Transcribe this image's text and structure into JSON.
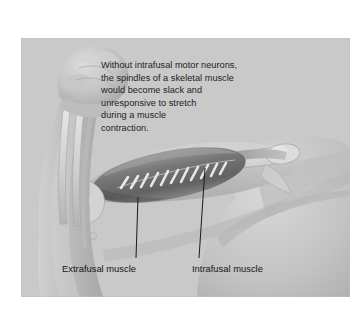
{
  "figure": {
    "domain": "diagram",
    "background_color": "#ffffff",
    "panel_color": "#c9c9c9"
  },
  "caption": {
    "text": "Without intrafusal motor neurons,\nthe spindles of a skeletal muscle\nwould become slack and\nunresponsive to stretch\nduring a muscle\ncontraction.",
    "color": "#1d1d1d"
  },
  "labels": [
    {
      "id": "extrafusal",
      "text": "Extrafusal muscle",
      "color": "#161616",
      "leader_line": {
        "x1": 138,
        "y1": 197,
        "x2": 136,
        "y2": 258
      }
    },
    {
      "id": "intrafusal",
      "text": "Intrafusal muscle",
      "color": "#161616",
      "leader_line": {
        "x1": 205,
        "y1": 168,
        "x2": 199,
        "y2": 258
      }
    }
  ],
  "anatomy": {
    "parts": [
      {
        "name": "clenched-fist",
        "tone": "#b9b9b9"
      },
      {
        "name": "forearm",
        "tone": "#bdbdbd"
      },
      {
        "name": "radius-bone",
        "tone": "#d6d6d6"
      },
      {
        "name": "ulna-bone",
        "tone": "#d6d6d6"
      },
      {
        "name": "elbow-joint",
        "tone": "#d2d2d2"
      },
      {
        "name": "humerus-bone",
        "tone": "#d4d4d4"
      },
      {
        "name": "upper-arm",
        "tone": "#c4c4c4"
      },
      {
        "name": "shoulder",
        "tone": "#c6c6c6"
      },
      {
        "name": "biceps-muscle-belly",
        "tone": "#7e7e7e"
      },
      {
        "name": "intrafusal-fibers",
        "tone": "#f2f2f2",
        "count": 11
      },
      {
        "name": "tendon",
        "tone": "#b0b0b0"
      }
    ]
  }
}
